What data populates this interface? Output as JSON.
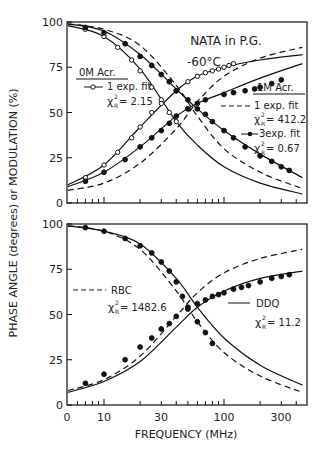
{
  "chart_data": [
    {
      "type": "line",
      "panel": "top",
      "title": "NATA in P.G.",
      "subtitle": "-60°C",
      "xlabel": "FREQUENCY (MHz)",
      "ylabel": "MODULATION (%)",
      "xscale": "log",
      "xlim": [
        5,
        450
      ],
      "ylim": [
        0,
        100
      ],
      "yticks": [
        0,
        25,
        50,
        75,
        100
      ],
      "grid": false,
      "annotations": [
        {
          "text": "0M Acr.",
          "underline": true
        },
        {
          "text": "1 exp. fit",
          "marker": "open-circle-line"
        },
        {
          "text": "χ²_R = 2.15"
        },
        {
          "text": "1M Acr.",
          "underline": true
        },
        {
          "text": "1 exp. fit",
          "marker": "dashed-line"
        },
        {
          "text": "χ²_R = 412.2"
        },
        {
          "text": "3exp. fit",
          "marker": "filled-circle-line"
        },
        {
          "text": "χ²_R = 0.67"
        }
      ],
      "series": [
        {
          "name": "0M Acr. phase (data, open circles)",
          "x": [
            7,
            10,
            13,
            17,
            20,
            25,
            30,
            35,
            40
          ],
          "y": [
            96,
            92,
            86,
            79,
            73,
            64,
            57,
            50,
            45
          ]
        },
        {
          "name": "0M Acr. modulation (data, open circles)",
          "x": [
            7,
            10,
            13,
            17,
            20,
            25,
            30,
            40,
            50,
            60,
            70,
            80,
            90,
            100,
            110,
            120
          ],
          "y": [
            14,
            21,
            28,
            36,
            42,
            50,
            55,
            62,
            67,
            70,
            72,
            73,
            74,
            75,
            76,
            77
          ]
        },
        {
          "name": "1M Acr. phase (data, filled circles)",
          "x": [
            7,
            10,
            15,
            20,
            25,
            30,
            35,
            40,
            50,
            60,
            70,
            80,
            100,
            120,
            150,
            200,
            250,
            300,
            350
          ],
          "y": [
            97,
            94,
            88,
            81,
            76,
            71,
            67,
            62,
            57,
            52,
            49,
            45,
            40,
            36,
            31,
            26,
            23,
            20,
            18
          ]
        },
        {
          "name": "1M Acr. modulation (data, filled circles)",
          "x": [
            7,
            10,
            15,
            20,
            25,
            30,
            35,
            40,
            50,
            60,
            70,
            100,
            120,
            150,
            180,
            200,
            250,
            300
          ],
          "y": [
            12,
            17,
            24,
            31,
            36,
            40,
            44,
            48,
            52,
            55,
            57,
            60,
            61,
            62,
            63,
            64,
            66,
            68
          ]
        },
        {
          "name": "1 exp. fit (dashed)",
          "x": [
            5,
            10,
            20,
            40,
            60,
            100,
            200,
            450
          ],
          "y_phase": [
            99,
            96,
            87,
            65,
            48,
            30,
            17,
            8
          ],
          "y_mod": [
            7,
            11,
            22,
            41,
            56,
            70,
            80,
            86
          ]
        },
        {
          "name": "3exp. fit (solid)",
          "x": [
            5,
            10,
            20,
            40,
            60,
            100,
            200,
            450
          ],
          "y_phase": [
            99,
            95,
            82,
            63,
            52,
            40,
            27,
            14
          ],
          "y_mod": [
            9,
            17,
            31,
            48,
            55,
            61,
            69,
            77
          ]
        }
      ]
    },
    {
      "type": "line",
      "panel": "bottom",
      "xlabel": "FREQUENCY (MHz)",
      "ylabel": "PHASE ANGLE (degrees)",
      "xscale": "log",
      "xlim": [
        5,
        450
      ],
      "ylim": [
        0,
        100
      ],
      "yticks": [
        0,
        25,
        50,
        75,
        100
      ],
      "xticks_labels": [
        "0",
        "10",
        "30",
        "100",
        "300"
      ],
      "grid": false,
      "annotations": [
        {
          "text": "RBC",
          "marker": "dashed-line"
        },
        {
          "text": "χ²_R = 1482.6"
        },
        {
          "text": "DDQ",
          "marker": "solid-line"
        },
        {
          "text": "χ²_R = 11.2"
        }
      ],
      "series": [
        {
          "name": "Phase data (filled circles)",
          "x": [
            7,
            10,
            15,
            20,
            25,
            30,
            35,
            40,
            45,
            50,
            60,
            70,
            80
          ],
          "y": [
            98,
            96,
            92,
            88,
            84,
            79,
            74,
            68,
            60,
            54,
            46,
            40,
            34
          ]
        },
        {
          "name": "Modulation data (filled circles)",
          "x": [
            7,
            10,
            15,
            20,
            25,
            30,
            35,
            40,
            50,
            60,
            70,
            80,
            90,
            100,
            120,
            140,
            160,
            200,
            250,
            300,
            350
          ],
          "y": [
            12,
            17,
            25,
            32,
            37,
            42,
            45,
            49,
            53,
            56,
            58,
            60,
            61,
            62,
            64,
            65,
            66,
            68,
            70,
            71,
            72
          ]
        },
        {
          "name": "RBC (dashed)",
          "x": [
            5,
            10,
            20,
            40,
            60,
            100,
            200,
            450
          ],
          "y_phase": [
            99,
            96,
            86,
            63,
            46,
            29,
            16,
            7
          ],
          "y_mod": [
            8,
            14,
            27,
            49,
            62,
            73,
            81,
            86
          ]
        },
        {
          "name": "DDQ (solid)",
          "x": [
            5,
            10,
            20,
            40,
            60,
            100,
            200,
            450
          ],
          "y_phase": [
            99,
            96,
            89,
            70,
            54,
            37,
            22,
            11
          ],
          "y_mod": [
            7,
            13,
            24,
            43,
            54,
            63,
            70,
            74
          ]
        }
      ]
    }
  ],
  "labels": {
    "title": "NATA in P.G.",
    "temp": "-60°C",
    "ylabel": "PHASE  ANGLE  (degrees)   or   MODULATION  (%)",
    "xlabel": "FREQUENCY  (MHz)",
    "acr0": "0M Acr.",
    "fit1a": "1 exp. fit",
    "chi_a": "= 2.15",
    "acr1": "1M Acr.",
    "fit1b": "1 exp. fit",
    "chi_b": "= 412.2",
    "fit3": "3exp. fit",
    "chi_c": "= 0.67",
    "rbc": "RBC",
    "chi_rbc": "= 1482.6",
    "ddq": "DDQ",
    "chi_ddq": "= 11.2",
    "chi": "χ",
    "sup": "2",
    "sub": "R"
  },
  "axes": {
    "yticks": [
      "0",
      "25",
      "50",
      "75",
      "100"
    ],
    "xticks": [
      "0",
      "10",
      "30",
      "100",
      "300"
    ]
  }
}
